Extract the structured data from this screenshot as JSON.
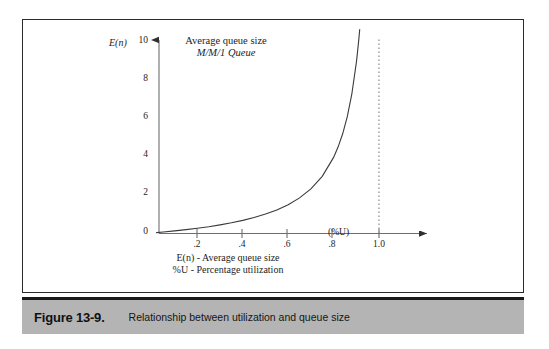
{
  "figure": {
    "caption_number": "Figure 13-9.",
    "caption_text": "Relationship between utilization and queue size",
    "frame_color": "#2b2b2b",
    "caption_bar_color": "#b4b4b4",
    "caption_rule_color": "#1a1a1a"
  },
  "chart_data": {
    "type": "line",
    "title": "Average queue size",
    "subtitle": "M/M/1 Queue",
    "xlabel": "(%U)",
    "ylabel": "E(n)",
    "xlim": [
      0,
      1.06
    ],
    "ylim": [
      0,
      11.2
    ],
    "grid": false,
    "legend": "none",
    "x_ticks": [
      0.2,
      0.4,
      0.6,
      0.8,
      1.0
    ],
    "x_tick_labels": [
      ".2",
      ".4",
      ".6",
      ".8",
      "1.0"
    ],
    "y_ticks": [
      0,
      2,
      4,
      6,
      8,
      10
    ],
    "y_tick_labels": [
      "0",
      "2",
      "4",
      "6",
      "8",
      "10"
    ],
    "origin_label": "0",
    "annotations": [
      "E(n) - Average queue size",
      "%U - Percentage utilization"
    ],
    "asymptote": {
      "x": 1.0,
      "style": "dotted",
      "color": "#9a9a9a"
    },
    "series": [
      {
        "name": "E(n) = rho / (1 - rho)",
        "color": "#3b3b3b",
        "x": [
          0.02,
          0.05,
          0.1,
          0.15,
          0.2,
          0.25,
          0.3,
          0.35,
          0.4,
          0.45,
          0.5,
          0.55,
          0.6,
          0.65,
          0.7,
          0.75,
          0.8,
          0.82,
          0.84,
          0.86,
          0.88,
          0.9,
          0.905,
          0.91,
          0.915
        ],
        "values": [
          0.02,
          0.05,
          0.11,
          0.18,
          0.25,
          0.33,
          0.43,
          0.54,
          0.67,
          0.82,
          1.0,
          1.22,
          1.5,
          1.86,
          2.33,
          3.0,
          4.0,
          4.56,
          5.25,
          6.14,
          7.33,
          9.0,
          9.53,
          10.11,
          10.76
        ]
      }
    ]
  },
  "axis_text": {
    "y_axis_caption": "E(n)",
    "x_axis_caption": "(%U)"
  }
}
